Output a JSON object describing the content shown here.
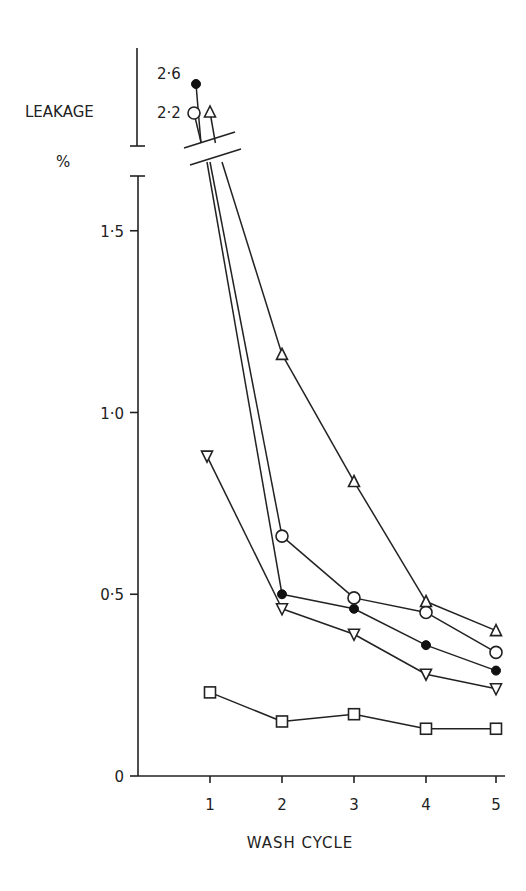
{
  "chart_data": {
    "type": "line",
    "title": "",
    "xlabel": "WASH CYCLE",
    "ylabel": "LEAKAGE",
    "ylabel_unit": "%",
    "x": [
      1,
      2,
      3,
      4,
      5
    ],
    "x_tick_labels": [
      "1",
      "2",
      "3",
      "4",
      "5"
    ],
    "y_tick_labels": [
      "0",
      "0·5",
      "1·0",
      "1·5"
    ],
    "y_ticks": [
      0,
      0.5,
      1.0,
      1.5
    ],
    "ylim": [
      0,
      1.65
    ],
    "axis_break": {
      "below": 1.65,
      "above_labels": [
        "2·6",
        "2·2"
      ]
    },
    "grid": false,
    "legend": null,
    "series": [
      {
        "name": "filled circle",
        "marker": "filled-circle",
        "values": [
          2.6,
          0.5,
          0.46,
          0.36,
          0.29
        ]
      },
      {
        "name": "open circle",
        "marker": "open-circle",
        "values": [
          2.2,
          0.66,
          0.49,
          0.45,
          0.34
        ]
      },
      {
        "name": "open triangle",
        "marker": "triangle-up",
        "values": [
          2.2,
          1.16,
          0.81,
          0.48,
          0.4
        ]
      },
      {
        "name": "inverted triangle",
        "marker": "triangle-down",
        "values": [
          0.88,
          0.46,
          0.39,
          0.28,
          0.24
        ]
      },
      {
        "name": "open square",
        "marker": "square",
        "values": [
          0.23,
          0.15,
          0.17,
          0.13,
          0.13
        ]
      }
    ]
  },
  "labels": {
    "y_axis_title": "LEAKAGE",
    "y_axis_unit": "%",
    "x_axis_title": "WASH CYCLE",
    "break_label_high": "2·6",
    "break_label_low": "2·2"
  }
}
